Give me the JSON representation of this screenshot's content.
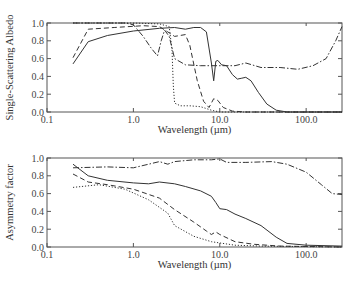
{
  "chart_data": [
    {
      "type": "line",
      "title": "",
      "xlabel": "Wavelength (µm)",
      "ylabel": "Single-Scattering Albedo",
      "xscale": "log",
      "xlim": [
        0.1,
        260
      ],
      "ylim": [
        0.0,
        1.0
      ],
      "xticks": [
        "0.1",
        "1.0",
        "10.0",
        "100.0"
      ],
      "yticks": [
        "0.0",
        "0.2",
        "0.4",
        "0.6",
        "0.8",
        "1.0"
      ],
      "grid": false,
      "legend": null,
      "series": [
        {
          "name": "solid",
          "style": "solid",
          "points": [
            [
              0.2,
              0.54
            ],
            [
              0.3,
              0.79
            ],
            [
              0.5,
              0.86
            ],
            [
              1.0,
              0.91
            ],
            [
              2.0,
              0.94
            ],
            [
              3.0,
              0.95
            ],
            [
              4.0,
              0.93
            ],
            [
              5.0,
              0.95
            ],
            [
              6.0,
              0.95
            ],
            [
              7.0,
              0.9
            ],
            [
              8.0,
              0.55
            ],
            [
              8.5,
              0.35
            ],
            [
              9.0,
              0.57
            ],
            [
              9.5,
              0.58
            ],
            [
              10.5,
              0.53
            ],
            [
              12.0,
              0.52
            ],
            [
              14.0,
              0.42
            ],
            [
              16.0,
              0.37
            ],
            [
              18.0,
              0.38
            ],
            [
              20.0,
              0.39
            ],
            [
              23.0,
              0.35
            ],
            [
              28.0,
              0.22
            ],
            [
              35.0,
              0.09
            ],
            [
              45.0,
              0.02
            ],
            [
              60.0,
              0.0
            ],
            [
              260.0,
              0.0
            ]
          ]
        },
        {
          "name": "dashed",
          "style": "dashed",
          "points": [
            [
              0.2,
              0.61
            ],
            [
              0.3,
              0.93
            ],
            [
              0.6,
              0.95
            ],
            [
              1.3,
              0.97
            ],
            [
              2.0,
              0.96
            ],
            [
              2.5,
              0.9
            ],
            [
              3.0,
              0.85
            ],
            [
              4.0,
              0.87
            ],
            [
              4.5,
              0.75
            ],
            [
              5.5,
              0.35
            ],
            [
              6.5,
              0.12
            ],
            [
              7.5,
              0.05
            ],
            [
              8.5,
              0.15
            ],
            [
              9.5,
              0.13
            ],
            [
              11.0,
              0.05
            ],
            [
              14.0,
              0.01
            ],
            [
              20.0,
              0.0
            ],
            [
              260.0,
              0.0
            ]
          ]
        },
        {
          "name": "dash-dot",
          "style": "dashdot",
          "points": [
            [
              0.2,
              1.0
            ],
            [
              0.8,
              1.0
            ],
            [
              1.0,
              0.98
            ],
            [
              1.3,
              0.85
            ],
            [
              1.6,
              0.72
            ],
            [
              1.9,
              0.63
            ],
            [
              2.1,
              0.8
            ],
            [
              2.3,
              0.92
            ],
            [
              2.6,
              0.85
            ],
            [
              3.0,
              0.6
            ],
            [
              4.0,
              0.53
            ],
            [
              6.0,
              0.52
            ],
            [
              10.0,
              0.52
            ],
            [
              15.0,
              0.52
            ],
            [
              20.0,
              0.55
            ],
            [
              30.0,
              0.5
            ],
            [
              50.0,
              0.5
            ],
            [
              80.0,
              0.48
            ],
            [
              120.0,
              0.52
            ],
            [
              170.0,
              0.6
            ],
            [
              220.0,
              0.8
            ],
            [
              260.0,
              0.96
            ]
          ]
        },
        {
          "name": "dotted",
          "style": "dotted",
          "points": [
            [
              0.2,
              1.0
            ],
            [
              1.0,
              1.0
            ],
            [
              2.0,
              0.99
            ],
            [
              2.6,
              0.96
            ],
            [
              2.8,
              0.7
            ],
            [
              2.9,
              0.3
            ],
            [
              3.0,
              0.1
            ],
            [
              3.5,
              0.07
            ],
            [
              4.5,
              0.07
            ],
            [
              6.0,
              0.06
            ],
            [
              8.0,
              0.02
            ],
            [
              10.0,
              0.0
            ],
            [
              260.0,
              0.0
            ]
          ]
        }
      ]
    },
    {
      "type": "line",
      "title": "",
      "xlabel": "Wavelength (µm)",
      "ylabel": "Asymmetry factor",
      "xscale": "log",
      "xlim": [
        0.1,
        260
      ],
      "ylim": [
        0.0,
        1.0
      ],
      "xticks": [
        "0.1",
        "1.0",
        "10.0",
        "100.0"
      ],
      "yticks": [
        "0.0",
        "0.2",
        "0.4",
        "0.6",
        "0.8",
        "1.0"
      ],
      "grid": false,
      "legend": null,
      "series": [
        {
          "name": "solid",
          "style": "solid",
          "points": [
            [
              0.2,
              0.93
            ],
            [
              0.3,
              0.8
            ],
            [
              0.5,
              0.75
            ],
            [
              1.0,
              0.72
            ],
            [
              1.5,
              0.71
            ],
            [
              2.0,
              0.73
            ],
            [
              3.0,
              0.71
            ],
            [
              4.0,
              0.68
            ],
            [
              6.0,
              0.63
            ],
            [
              8.0,
              0.57
            ],
            [
              9.0,
              0.5
            ],
            [
              10.0,
              0.43
            ],
            [
              12.0,
              0.42
            ],
            [
              15.0,
              0.37
            ],
            [
              20.0,
              0.32
            ],
            [
              30.0,
              0.24
            ],
            [
              45.0,
              0.11
            ],
            [
              60.0,
              0.04
            ],
            [
              100.0,
              0.02
            ],
            [
              260.0,
              0.01
            ]
          ]
        },
        {
          "name": "dashed",
          "style": "dashed",
          "points": [
            [
              0.2,
              0.82
            ],
            [
              0.3,
              0.73
            ],
            [
              0.5,
              0.7
            ],
            [
              1.0,
              0.65
            ],
            [
              2.0,
              0.55
            ],
            [
              3.0,
              0.42
            ],
            [
              5.0,
              0.28
            ],
            [
              7.0,
              0.18
            ],
            [
              8.0,
              0.14
            ],
            [
              9.0,
              0.17
            ],
            [
              10.0,
              0.14
            ],
            [
              15.0,
              0.06
            ],
            [
              25.0,
              0.03
            ],
            [
              50.0,
              0.01
            ],
            [
              260.0,
              0.0
            ]
          ]
        },
        {
          "name": "dash-dot",
          "style": "dashdot",
          "points": [
            [
              0.2,
              0.89
            ],
            [
              0.5,
              0.9
            ],
            [
              1.0,
              0.89
            ],
            [
              1.5,
              0.93
            ],
            [
              2.0,
              0.96
            ],
            [
              2.5,
              0.93
            ],
            [
              3.0,
              0.96
            ],
            [
              5.0,
              0.98
            ],
            [
              8.0,
              0.98
            ],
            [
              10.0,
              0.99
            ],
            [
              12.0,
              0.95
            ],
            [
              20.0,
              0.95
            ],
            [
              40.0,
              0.96
            ],
            [
              60.0,
              0.93
            ],
            [
              100.0,
              0.84
            ],
            [
              150.0,
              0.7
            ],
            [
              200.0,
              0.6
            ],
            [
              260.0,
              0.59
            ]
          ]
        },
        {
          "name": "dotted",
          "style": "dotted",
          "points": [
            [
              0.2,
              0.67
            ],
            [
              0.4,
              0.7
            ],
            [
              0.8,
              0.65
            ],
            [
              1.5,
              0.53
            ],
            [
              2.5,
              0.38
            ],
            [
              3.0,
              0.24
            ],
            [
              5.0,
              0.12
            ],
            [
              8.0,
              0.06
            ],
            [
              15.0,
              0.02
            ],
            [
              30.0,
              0.01
            ],
            [
              260.0,
              0.0
            ]
          ]
        }
      ]
    }
  ],
  "labels": {
    "top_ylabel": "Single-Scattering Albedo",
    "bottom_ylabel": "Asymmetry factor",
    "xlabel": "Wavelength (µm)",
    "xticks": [
      "0.1",
      "1.0",
      "10.0",
      "100.0"
    ],
    "yticks": [
      "0.0",
      "0.2",
      "0.4",
      "0.6",
      "0.8",
      "1.0"
    ]
  }
}
